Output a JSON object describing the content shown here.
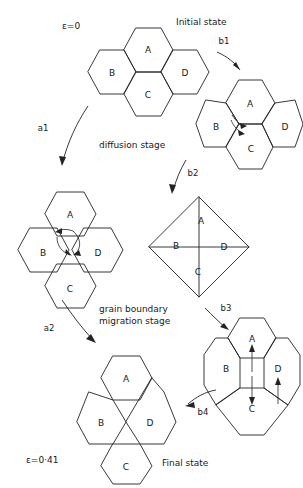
{
  "figure": {
    "type": "diagram",
    "background_color": "#ffffff",
    "line_color": "#232323"
  },
  "grain_names": [
    "A",
    "B",
    "C",
    "D"
  ],
  "annotations": {
    "initial_strain": "ε=0",
    "initial_state": "Initial state",
    "final_strain": "ε=0·41",
    "final_state": "Final state",
    "diffusion_stage": "diffusion stage",
    "migration_stage_line1": "grain boundary",
    "migration_stage_line2": "migration stage"
  },
  "transitions": [
    {
      "id": "a1",
      "label": "a1"
    },
    {
      "id": "a2",
      "label": "a2"
    },
    {
      "id": "b1",
      "label": "b1"
    },
    {
      "id": "b2",
      "label": "b2"
    },
    {
      "id": "b3",
      "label": "b3"
    },
    {
      "id": "b4",
      "label": "b4"
    }
  ],
  "states": {
    "initial": {
      "name": "initial-state-cluster",
      "strain": "ε=0",
      "caption": "Initial state",
      "grains": [
        "A",
        "B",
        "C",
        "D"
      ]
    },
    "a1": {
      "name": "a1-state-cluster",
      "caption": "diffusion intermediate",
      "grains": [
        "A",
        "B",
        "C",
        "D"
      ]
    },
    "b1": {
      "name": "b1-state-cluster",
      "caption": "grain boundary migration first step",
      "grains": [
        "A",
        "B",
        "C",
        "D"
      ]
    },
    "b2": {
      "name": "b2-state-cluster",
      "caption": "square diamond configuration",
      "grains": [
        "A",
        "B",
        "C",
        "D"
      ]
    },
    "b3": {
      "name": "b3-state-cluster",
      "caption": "elongated configuration",
      "grains": [
        "A",
        "B",
        "C",
        "D"
      ]
    },
    "final": {
      "name": "final-state-cluster",
      "strain": "ε=0·41",
      "caption": "Final state",
      "grains": [
        "A",
        "B",
        "C",
        "D"
      ]
    }
  }
}
